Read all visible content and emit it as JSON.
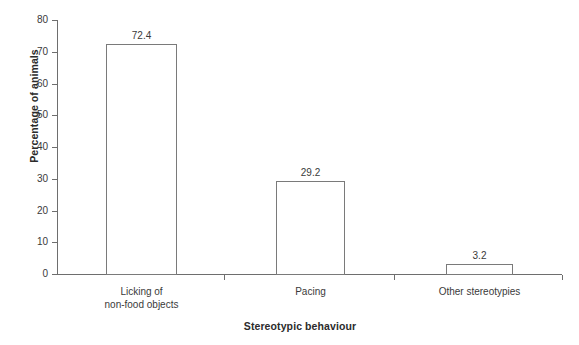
{
  "chart_data": {
    "type": "bar",
    "title": "",
    "subtitle": "",
    "xlabel": "Stereotypic behaviour",
    "ylabel": "Percentage of animals",
    "categories": [
      "Licking of non-food objects",
      "Pacing",
      "Other stereotypies"
    ],
    "category_lines": [
      [
        "Licking of",
        "non-food objects"
      ],
      [
        "Pacing"
      ],
      [
        "Other stereotypies"
      ]
    ],
    "values": [
      72.4,
      29.2,
      3.2
    ],
    "value_labels": [
      "72.4",
      "29.2",
      "3.2"
    ],
    "ylim": [
      0,
      80
    ],
    "ytick_labels": [
      "0",
      "10",
      "20",
      "30",
      "40",
      "50",
      "60",
      "70",
      "80"
    ],
    "ytick_values": [
      0,
      10,
      20,
      30,
      40,
      50,
      60,
      70,
      80
    ],
    "grid": false,
    "legend": "none",
    "colors": {
      "bar_fill": "#ffffff",
      "bar_edge": "#7a7a7a",
      "axis": "#6e6e6e",
      "text": "#3a3a3a",
      "background": "#ffffff"
    }
  }
}
